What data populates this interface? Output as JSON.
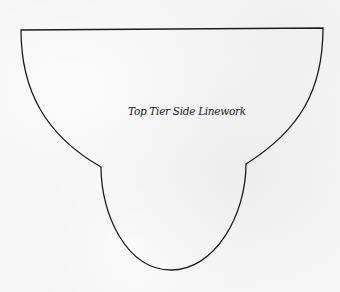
{
  "diagram": {
    "label": "Top Tier Side Linework",
    "stroke_color": "#1c1c1c",
    "background_color": "#f5f5f5",
    "outline": {
      "top_left": [
        21,
        30
      ],
      "top_right": [
        323,
        28
      ],
      "left_notch": [
        101,
        167
      ],
      "right_notch": [
        246,
        164
      ],
      "bottom": [
        171,
        270
      ]
    }
  }
}
